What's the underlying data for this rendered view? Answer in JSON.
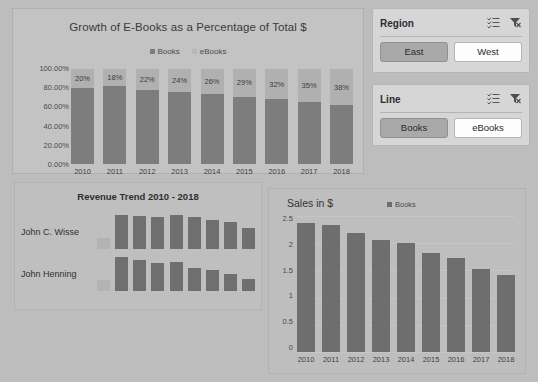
{
  "colors": {
    "page_bg": "#bdbdbd",
    "books_series": "#7d7d7d",
    "ebooks_series": "#b0b0b0",
    "selected_slicer": "#a9a9a9",
    "panel_bg": "#c3c3c3"
  },
  "stacked_chart": {
    "title": "Growth of E-Books as a Percentage of Total $",
    "legend": [
      "Books",
      "eBooks"
    ],
    "y_ticks": [
      "100.00%",
      "80.00%",
      "60.00%",
      "40.00%",
      "20.00%",
      "0.00%"
    ]
  },
  "trend_chart": {
    "title": "Revenue Trend 2010 - 2018",
    "rows": [
      {
        "name": "John C. Wisse"
      },
      {
        "name": "John Henning"
      }
    ]
  },
  "sales_chart": {
    "title": "Sales in $",
    "legend": [
      "Books"
    ],
    "y_ticks": [
      "2.5",
      "2",
      "1.5",
      "1",
      "0.5",
      "0"
    ]
  },
  "slicers": [
    {
      "title": "Region",
      "multiselect_icon": "multi-select-icon",
      "clearfilter_icon": "clear-filter-icon",
      "items": [
        {
          "label": "East",
          "selected": true
        },
        {
          "label": "West",
          "selected": false
        }
      ]
    },
    {
      "title": "Line",
      "multiselect_icon": "multi-select-icon",
      "clearfilter_icon": "clear-filter-icon",
      "items": [
        {
          "label": "Books",
          "selected": true
        },
        {
          "label": "eBooks",
          "selected": false
        }
      ]
    }
  ],
  "chart_data": [
    {
      "type": "bar",
      "id": "growth-of-ebooks-stacked",
      "title": "Growth of E-Books as a Percentage of Total $",
      "subtype": "stacked-100-percent",
      "xlabel": "",
      "ylabel": "",
      "ylim": [
        0,
        1
      ],
      "ytick_values": [
        1.0,
        0.8,
        0.6,
        0.4,
        0.2,
        0.0
      ],
      "ytick_labels": [
        "100.00%",
        "80.00%",
        "60.00%",
        "40.00%",
        "20.00%",
        "0.00%"
      ],
      "grid": false,
      "legend": [
        "Books",
        "eBooks"
      ],
      "legend_position": "top-center",
      "categories": [
        "2010",
        "2011",
        "2012",
        "2013",
        "2014",
        "2015",
        "2016",
        "2017",
        "2018"
      ],
      "series": [
        {
          "name": "Books",
          "values": [
            0.8,
            0.82,
            0.78,
            0.76,
            0.74,
            0.71,
            0.68,
            0.65,
            0.62
          ]
        },
        {
          "name": "eBooks",
          "values": [
            0.2,
            0.18,
            0.22,
            0.24,
            0.26,
            0.29,
            0.32,
            0.35,
            0.38
          ]
        }
      ],
      "data_labels": [
        "20%",
        "18%",
        "22%",
        "24%",
        "26%",
        "29%",
        "32%",
        "35%",
        "38%"
      ]
    },
    {
      "type": "bar",
      "id": "revenue-trend-sparklines",
      "title": "Revenue Trend 2010 - 2018",
      "subtype": "sparkline-rows",
      "grid": false,
      "categories": [
        "2010",
        "2011",
        "2012",
        "2013",
        "2014",
        "2015",
        "2016",
        "2017",
        "2018"
      ],
      "series": [
        {
          "name": "John C. Wisse",
          "values": [
            0.32,
            1.0,
            0.97,
            0.94,
            1.0,
            0.94,
            0.85,
            0.79,
            0.62
          ]
        },
        {
          "name": "John Henning",
          "values": [
            0.32,
            1.0,
            0.91,
            0.82,
            0.85,
            0.68,
            0.62,
            0.5,
            0.35
          ]
        }
      ]
    },
    {
      "type": "bar",
      "id": "sales-in-dollars",
      "title": "Sales in $",
      "xlabel": "",
      "ylabel": "",
      "ylim": [
        0,
        2.5
      ],
      "ytick_values": [
        2.5,
        2.0,
        1.5,
        1.0,
        0.5,
        0.0
      ],
      "ytick_labels": [
        "2.5",
        "2",
        "1.5",
        "1",
        "0.5",
        "0"
      ],
      "grid": true,
      "legend": [
        "Books"
      ],
      "legend_position": "top-center",
      "categories": [
        "2010",
        "2011",
        "2012",
        "2013",
        "2014",
        "2015",
        "2016",
        "2017",
        "2018"
      ],
      "series": [
        {
          "name": "Books",
          "values": [
            2.38,
            2.33,
            2.18,
            2.05,
            2.0,
            1.82,
            1.73,
            1.53,
            1.42
          ]
        }
      ]
    }
  ]
}
